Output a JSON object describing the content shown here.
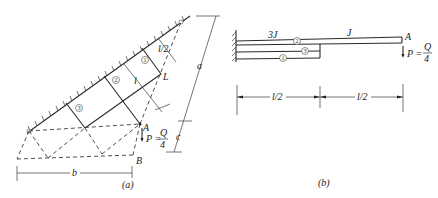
{
  "figure_a": {
    "caption": "(a)",
    "labels": {
      "point_A": "A",
      "point_B": "B",
      "point_L": "L",
      "load": "P =",
      "load_num": "Q",
      "load_den": "4",
      "dim_a": "a",
      "dim_c": "c",
      "dim_b": "b",
      "dim_l2": "l/2",
      "dim_l": "l"
    },
    "members": [
      "1",
      "2",
      "3"
    ]
  },
  "figure_b": {
    "caption": "(b)",
    "labels": {
      "stiffness_left": "3J",
      "stiffness_right": "J",
      "point_A": "A",
      "load": "P =",
      "load_num": "Q",
      "load_den": "4",
      "dim_left": "l/2",
      "dim_right": "l/2"
    },
    "members": [
      "2",
      "3",
      "1"
    ]
  }
}
